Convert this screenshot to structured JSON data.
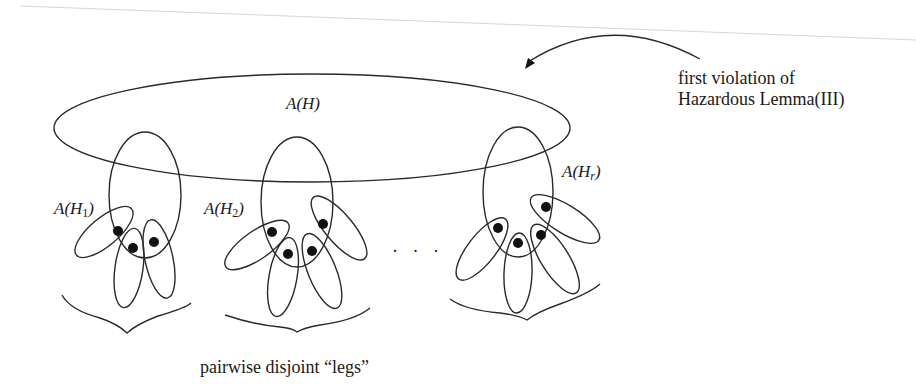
{
  "diagram": {
    "type": "set-inclusion-figure",
    "main_set": {
      "label_var": "A",
      "label_arg": "H",
      "label": "A(H)"
    },
    "subsets": [
      {
        "label": "A(H_1)",
        "base": "H",
        "subscript": "1",
        "legs": 3
      },
      {
        "label": "A(H_2)",
        "base": "H",
        "subscript": "2",
        "legs": 4
      },
      {
        "label": "A(H_r)",
        "base": "H",
        "subscript": "r",
        "legs": 4
      }
    ],
    "ellipsis": "· · ·",
    "annotation": {
      "line1": "first violation of",
      "line2": "Hazardous Lemma(III)",
      "arrow": "curved-arrow-pointing-to-A(H)"
    },
    "caption": "pairwise disjoint “legs”",
    "colors": {
      "stroke": "#2a2a2a",
      "dot": "#111111",
      "text": "#1a1a1a",
      "background": "#ffffff"
    }
  }
}
